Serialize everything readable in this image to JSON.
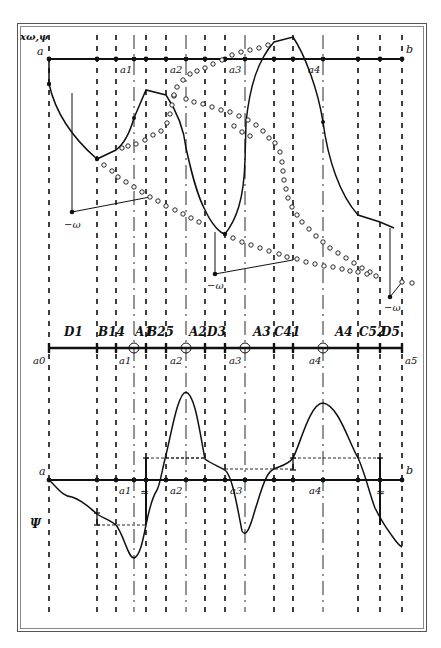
{
  "figure": {
    "y_axis_label": "xω,ψ",
    "psi_label": "Ψ",
    "omega_label": "−ω",
    "approx_symbol": "≈"
  },
  "top_axis": {
    "start_label": "a",
    "end_label": "b",
    "point_labels": [
      "a1",
      "a2",
      "a3",
      "a4"
    ]
  },
  "middle_axis": {
    "point_labels": [
      "a0",
      "a1",
      "a2",
      "a3",
      "a4",
      "a5"
    ],
    "interval_labels": [
      "D1",
      "B14",
      "A1",
      "B25",
      "A2",
      "D3",
      "A3",
      "C41",
      "A4",
      "C52",
      "D5"
    ]
  },
  "bottom_axis": {
    "start_label": "a",
    "end_label": "b",
    "point_labels": [
      "a1",
      "a2",
      "a3",
      "a4"
    ]
  },
  "vertical_lines": {
    "dashed_x": [
      49,
      97,
      116,
      146,
      166,
      205,
      225,
      274,
      293,
      358,
      380,
      402
    ],
    "dashdot_x": [
      134,
      186,
      245,
      323
    ]
  },
  "colors": {
    "ink": "#111111",
    "frame": "#666666",
    "background": "#ffffff"
  }
}
